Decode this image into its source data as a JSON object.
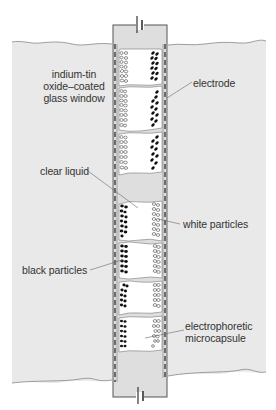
{
  "diagram": {
    "colors": {
      "panel_fill": "#e8e8e8",
      "column_fill": "#dcdcdc",
      "capsule_fill": "#ffffff",
      "stroke": "#555555",
      "black_particle": "#111111",
      "text": "#333333"
    },
    "labels": {
      "glass_window_line1": "indium-tin",
      "glass_window_line2": "oxide–coated",
      "glass_window_line3": "glass window",
      "electrode": "electrode",
      "clear_liquid": "clear liquid",
      "white_particles": "white particles",
      "black_particles": "black particles",
      "microcapsule_line1": "electrophoretic",
      "microcapsule_line2": "microcapsule"
    },
    "components": {
      "top_battery": "battery-symbol",
      "bottom_battery": "battery-symbol",
      "capsules_top_group": 3,
      "capsules_bottom_group": 4
    }
  }
}
